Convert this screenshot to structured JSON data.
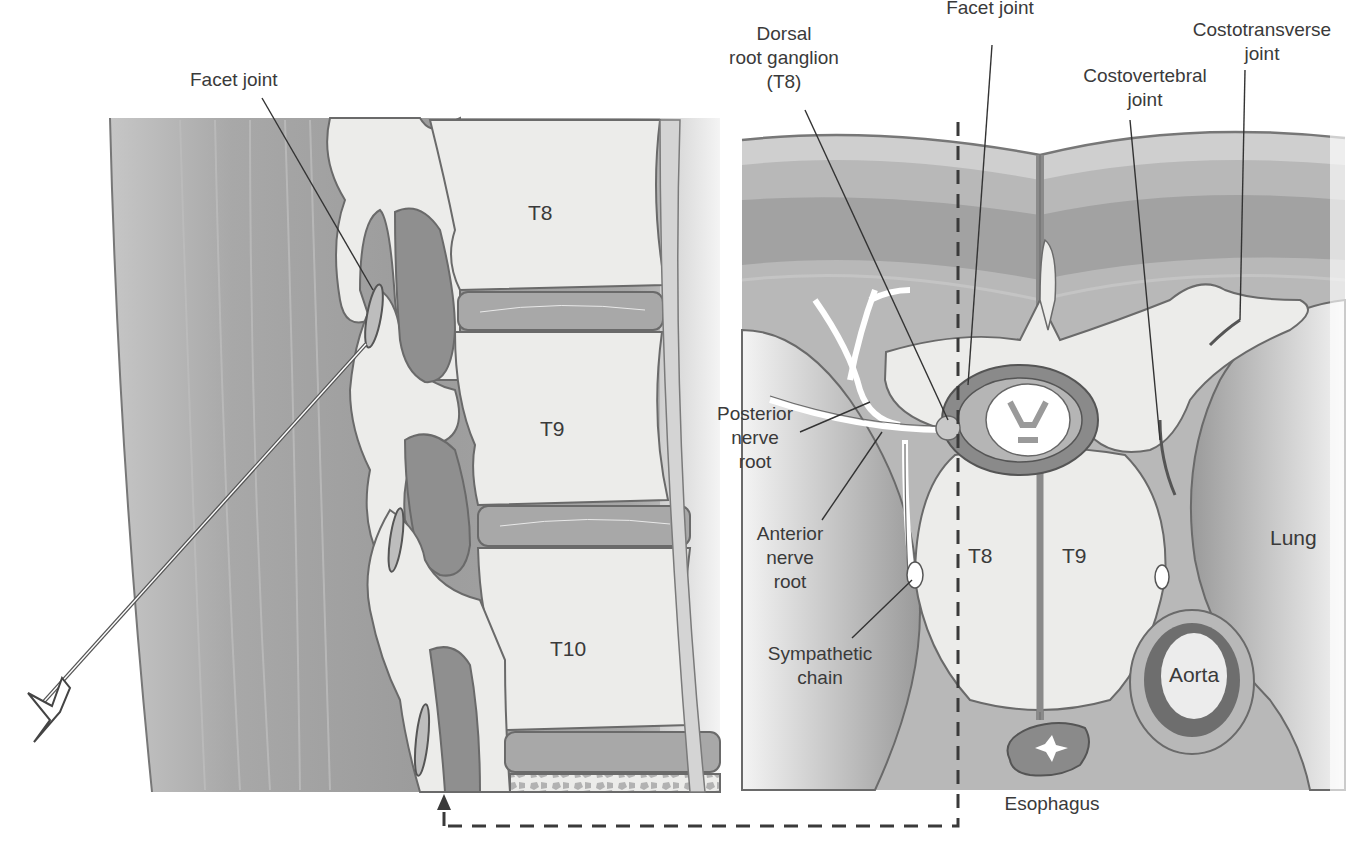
{
  "figure": {
    "colors": {
      "background": "#ffffff",
      "muscle_dark": "#9a9a9a",
      "muscle_mid": "#b3b3b3",
      "skin": "#c8c8c8",
      "bone_fill": "#ececea",
      "bone_pore": "#b0b0b0",
      "disc": "#a8a8a8",
      "text": "#3a3a3a",
      "lines": "#333333"
    }
  },
  "left_panel": {
    "title": "Sagittal view",
    "labels": {
      "facet_joint": "Facet joint",
      "vertebra_1": "T8",
      "vertebra_2": "T9",
      "vertebra_3": "T10"
    },
    "instrument": "spinal-needle"
  },
  "right_panel": {
    "title": "Axial view",
    "labels": {
      "dorsal_root_ganglion_line1": "Dorsal",
      "dorsal_root_ganglion_line2": "root ganglion",
      "dorsal_root_ganglion_line3": "(T8)",
      "facet_joint": "Facet joint",
      "costotransverse_line1": "Costotransverse",
      "costotransverse_line2": "joint",
      "costovertebral_line1": "Costovertebral",
      "costovertebral_line2": "joint",
      "posterior_line1": "Posterior",
      "posterior_line2": "nerve",
      "posterior_line3": "root",
      "anterior_line1": "Anterior",
      "anterior_line2": "nerve",
      "anterior_line3": "root",
      "sympathetic_line1": "Sympathetic",
      "sympathetic_line2": "chain",
      "vertebra_left": "T8",
      "vertebra_right": "T9",
      "lung": "Lung",
      "aorta": "Aorta",
      "esophagus": "Esophagus"
    }
  },
  "connector": {
    "style": "dashed",
    "meaning": "axial plane reference linking to sagittal view"
  }
}
